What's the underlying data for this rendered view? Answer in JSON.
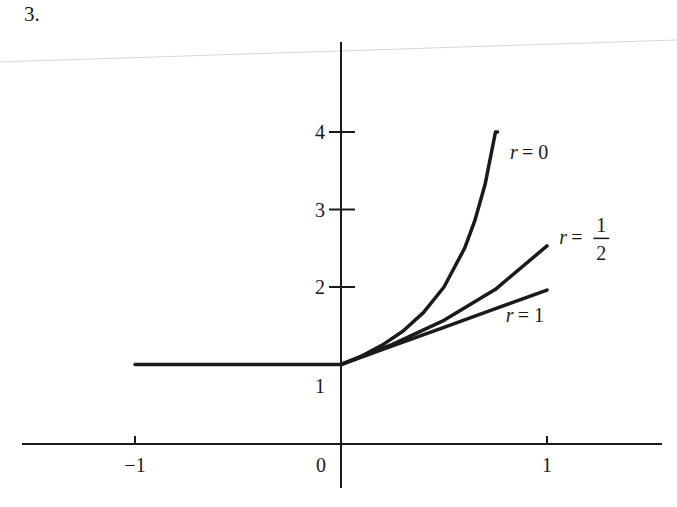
{
  "problem_number": "3.",
  "chart_data": {
    "type": "line",
    "title": "",
    "xlabel": "",
    "ylabel": "",
    "xlim": [
      -1.0,
      1.5
    ],
    "ylim": [
      -0.6,
      5.2
    ],
    "grid": false,
    "x_ticks": [
      {
        "value": -1,
        "label": "−1"
      },
      {
        "value": 0,
        "label": "0"
      },
      {
        "value": 1,
        "label": "1"
      }
    ],
    "y_ticks": [
      {
        "value": 1,
        "label": "1",
        "tick": false
      },
      {
        "value": 2,
        "label": "2",
        "tick": true
      },
      {
        "value": 3,
        "label": "3",
        "tick": true
      },
      {
        "value": 4,
        "label": "4",
        "tick": true
      }
    ],
    "series": [
      {
        "name": "flat",
        "label": "",
        "x": [
          -1,
          0
        ],
        "y": [
          1,
          1
        ]
      },
      {
        "name": "r = 0",
        "label": "r = 0",
        "x": [
          0,
          0.1,
          0.2,
          0.3,
          0.4,
          0.5,
          0.6,
          0.65,
          0.7,
          0.75,
          0.76
        ],
        "y": [
          1,
          1.11,
          1.25,
          1.43,
          1.67,
          2.0,
          2.5,
          2.86,
          3.33,
          4.0,
          4.0
        ]
      },
      {
        "name": "r = 1/2",
        "label": "r = 1/2",
        "x": [
          0,
          0.25,
          0.5,
          0.75,
          1.0
        ],
        "y": [
          1,
          1.26,
          1.57,
          1.97,
          2.53
        ]
      },
      {
        "name": "r = 1",
        "label": "r = 1",
        "x": [
          0,
          0.25,
          0.5,
          0.75,
          1.0
        ],
        "y": [
          1,
          1.24,
          1.48,
          1.72,
          1.96
        ]
      }
    ],
    "annotations": [
      {
        "text_var": "r",
        "text_eq": "= 0",
        "x": 0.82,
        "y": 3.65
      },
      {
        "text_var": "r",
        "text_eq": "=",
        "frac_num": "1",
        "frac_den": "2",
        "x": 1.06,
        "y": 2.55
      },
      {
        "text_var": "r",
        "text_eq": "= 1",
        "x": 0.8,
        "y": 1.55
      }
    ]
  },
  "colors": {
    "ink": "#1a1a1a",
    "background": "#ffffff",
    "scan_line": "#d8d8d8"
  }
}
